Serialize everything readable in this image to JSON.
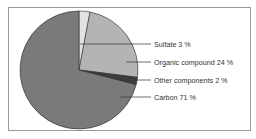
{
  "chart_data": {
    "type": "pie",
    "title": "",
    "start_angle_deg": 0,
    "direction": "clockwise",
    "slices": [
      {
        "label": "Sulfate",
        "value": 3,
        "display": "Sulfate 3 %",
        "color": "#e2e2e2"
      },
      {
        "label": "Organic compound",
        "value": 24,
        "display": "Organic compound 24 %",
        "color": "#b4b4b4"
      },
      {
        "label": "Other components",
        "value": 2,
        "display": "Other components 2 %",
        "color": "#3c3c3c"
      },
      {
        "label": "Carbon",
        "value": 71,
        "display": "Carbon 71 %",
        "color": "#7a7a7a"
      }
    ],
    "legend_position": "right, leader lines"
  }
}
